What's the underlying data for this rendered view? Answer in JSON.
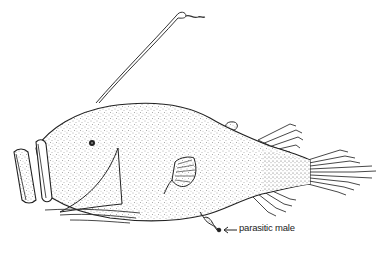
{
  "figure": {
    "annotation": {
      "text": "parasitic male",
      "arrow": "left-arrow"
    },
    "colors": {
      "ink": "#222222",
      "background": "#ffffff"
    }
  }
}
